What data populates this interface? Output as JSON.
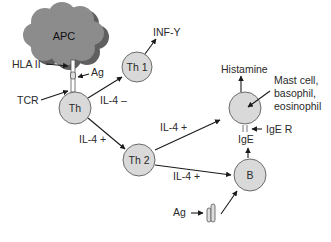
{
  "diagram": {
    "type": "immunology pathway diagram",
    "nodes": {
      "apc": {
        "label": "APC",
        "shape": "cloud"
      },
      "th": {
        "label": "Th"
      },
      "th1": {
        "label": "Th 1"
      },
      "th2": {
        "label": "Th 2"
      },
      "b": {
        "label": "B"
      },
      "mast": {
        "label": "Mast cell,\nbasophil,\neosinophil",
        "lines": [
          "Mast cell,",
          "basophil,",
          "eosinophil"
        ]
      }
    },
    "labels": {
      "hla": "HLA II",
      "ag_top": "Ag",
      "tcr": "TCR",
      "inf": "INF-Y",
      "il4_minus": "IL-4 –",
      "il4_plus_th": "IL-4 +",
      "il4_plus_mast": "IL-4 +",
      "il4_plus_b": "IL-4 +",
      "histamine": "Histamine",
      "ige_r": "IgE R",
      "ige": "IgE",
      "ag_bottom": "Ag"
    },
    "edges": [
      {
        "from": "Th",
        "to": "Th 1",
        "label": "IL-4 –"
      },
      {
        "from": "Th 1",
        "to": "INF-Y"
      },
      {
        "from": "Th",
        "to": "Th 2",
        "label": "IL-4 +"
      },
      {
        "from": "Th 2",
        "to": "Mast cell",
        "label": "IL-4 +"
      },
      {
        "from": "Th 2",
        "to": "B",
        "label": "IL-4 +"
      },
      {
        "from": "B",
        "to": "IgE"
      },
      {
        "from": "Mast cell",
        "to": "Histamine"
      },
      {
        "from": "Ag",
        "to": "B"
      }
    ],
    "colors": {
      "cell_fill": "#d9d9d9",
      "cell_stroke": "#6b6b6b",
      "cloud_fill": "#8c8c8c",
      "cloud_shadow": "#5f5f5f",
      "arrow": "#1a1a1a"
    }
  }
}
